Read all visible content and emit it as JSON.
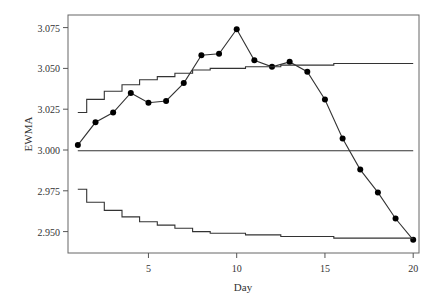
{
  "chart_data": {
    "type": "line",
    "title": "",
    "xlabel": "Day",
    "ylabel": "EWMA",
    "xlim": [
      0.5,
      20.5
    ],
    "ylim": [
      2.937,
      3.083
    ],
    "x_ticks": [
      5,
      10,
      15,
      20
    ],
    "x_tick_labels": [
      "5",
      "10",
      "15",
      "20"
    ],
    "y_ticks": [
      2.95,
      2.975,
      3.0,
      3.025,
      3.05,
      3.075
    ],
    "y_tick_labels": [
      "2.950",
      "2.975",
      "3.000",
      "3.025",
      "3.050",
      "3.075"
    ],
    "grid": false,
    "legend": null,
    "x": [
      1,
      2,
      3,
      4,
      5,
      6,
      7,
      8,
      9,
      10,
      11,
      12,
      13,
      14,
      15,
      16,
      17,
      18,
      19,
      20
    ],
    "series": [
      {
        "name": "EWMA",
        "style": "line-with-markers",
        "values": [
          3.003,
          3.017,
          3.023,
          3.035,
          3.029,
          3.03,
          3.041,
          3.058,
          3.059,
          3.074,
          3.055,
          3.051,
          3.054,
          3.048,
          3.031,
          3.007,
          2.988,
          2.974,
          2.958,
          2.945
        ]
      },
      {
        "name": "UCL",
        "style": "step",
        "values": [
          3.023,
          3.031,
          3.036,
          3.04,
          3.043,
          3.045,
          3.047,
          3.049,
          3.05,
          3.05,
          3.051,
          3.051,
          3.052,
          3.052,
          3.052,
          3.053,
          3.053,
          3.053,
          3.053,
          3.053
        ]
      },
      {
        "name": "Center line",
        "style": "line",
        "values": [
          2.9995,
          2.9995,
          2.9995,
          2.9995,
          2.9995,
          2.9995,
          2.9995,
          2.9995,
          2.9995,
          2.9995,
          2.9995,
          2.9995,
          2.9995,
          2.9995,
          2.9995,
          2.9995,
          2.9995,
          2.9995,
          2.9995,
          2.9995
        ]
      },
      {
        "name": "LCL",
        "style": "step",
        "values": [
          2.976,
          2.968,
          2.963,
          2.959,
          2.956,
          2.954,
          2.952,
          2.95,
          2.949,
          2.949,
          2.948,
          2.948,
          2.947,
          2.947,
          2.947,
          2.946,
          2.946,
          2.946,
          2.946,
          2.946
        ]
      }
    ]
  },
  "colors": {
    "axis": "#555555",
    "series": "#333333",
    "marker": "#000000",
    "background": "#ffffff"
  }
}
